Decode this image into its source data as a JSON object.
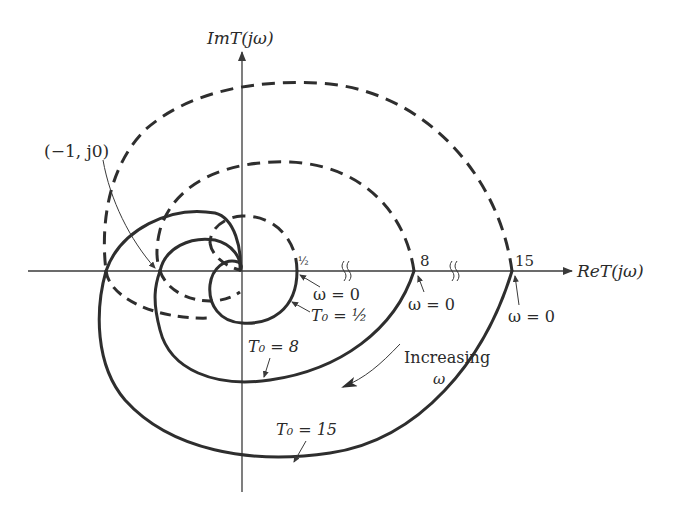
{
  "figure": {
    "type": "nyquist_plot",
    "axes": {
      "x_label": "ReT(jω)",
      "y_label": "ImT(jω)",
      "x_break_marks": 2
    },
    "point_label": "(−1, j0)",
    "axis_tick_labels": {
      "half": "½",
      "eight": "8",
      "fifteen": "15"
    },
    "annotations": {
      "omega_zero_half": "ω = 0",
      "t0_half": "T₀ = ½",
      "omega_zero_8": "ω = 0",
      "omega_zero_15": "ω = 0",
      "t0_8": "T₀ = 8",
      "t0_15": "T₀ = 15",
      "increasing": "Increasing",
      "omega": "ω"
    },
    "curves": [
      {
        "name": "T0 = 1/2",
        "start_re": 0.5,
        "style": "solid (ω>0), dashed mirror (ω<0)"
      },
      {
        "name": "T0 = 8",
        "start_re": 8,
        "style": "solid (ω>0), dashed mirror (ω<0)"
      },
      {
        "name": "T0 = 15",
        "start_re": 15,
        "style": "solid (ω>0), dashed mirror (ω<0)"
      }
    ],
    "colors": {
      "ink": "#2e2e2e",
      "background": "#ffffff"
    }
  }
}
